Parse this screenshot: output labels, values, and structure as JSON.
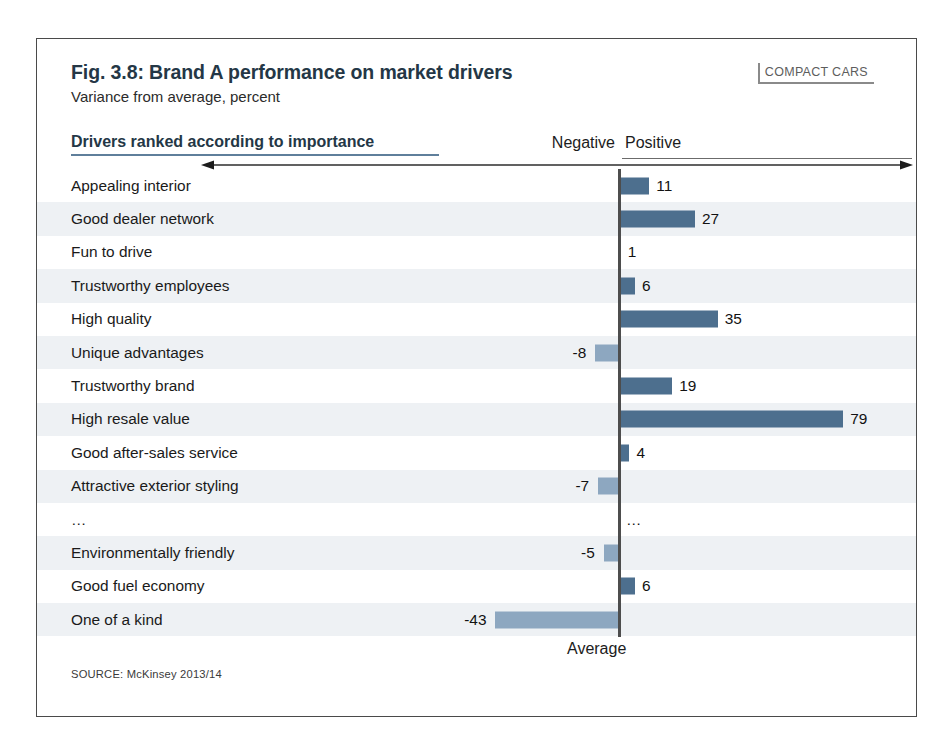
{
  "figure": {
    "title": "Fig. 3.8: Brand A performance on market drivers",
    "subtitle": "Variance from average, percent",
    "segment_tag": "COMPACT CARS",
    "source": "SOURCE: McKinsey 2013/14",
    "column_header": "Drivers ranked according to importance",
    "negative_label": "Negative",
    "positive_label": "Positive",
    "baseline_label": "Average"
  },
  "colors": {
    "title": "#243746",
    "positive_bar": "#4d6f8e",
    "negative_bar": "#8da7c0",
    "header_rule": "#5f7f9b",
    "row_shade": "#eef1f4",
    "axis_line": "#4d4d4d",
    "frame": "#4a4a4a",
    "segment_tag_border": "#8a8a8a"
  },
  "chart_data": {
    "type": "bar",
    "title": "Fig. 3.8: Brand A performance on market drivers",
    "subtitle": "Variance from average, percent",
    "orientation": "horizontal",
    "xlabel": "Variance from average, percent",
    "ylabel": "Drivers ranked according to importance",
    "baseline": 0,
    "baseline_label": "Average",
    "grid": false,
    "legend": null,
    "annotations": [
      "Negative",
      "Positive"
    ],
    "xlim": [
      -50,
      85
    ],
    "note": "Rows ordered top-to-bottom by driver importance; ellipsis row marks omitted drivers",
    "categories": [
      "Appealing interior",
      "Good dealer network",
      "Fun to drive",
      "Trustworthy employees",
      "High quality",
      "Unique advantages",
      "Trustworthy brand",
      "High resale value",
      "Good after-sales service",
      "Attractive exterior styling",
      "…",
      "Environmentally friendly",
      "Good fuel economy",
      "One of a kind"
    ],
    "values": [
      11,
      27,
      1,
      6,
      35,
      -8,
      19,
      79,
      4,
      -7,
      null,
      -5,
      6,
      -43
    ],
    "value_labels": [
      "11",
      "27",
      "1",
      "6",
      "35",
      "-8",
      "19",
      "79",
      "4",
      "-7",
      "…",
      "-5",
      "6",
      "-43"
    ],
    "source": "McKinsey 2013/14"
  },
  "rows": [
    {
      "label": "Appealing interior",
      "value": 11,
      "label_text": "11",
      "sign": "pos",
      "shade": false
    },
    {
      "label": "Good dealer network",
      "value": 27,
      "label_text": "27",
      "sign": "pos",
      "shade": true
    },
    {
      "label": "Fun to drive",
      "value": 1,
      "label_text": "1",
      "sign": "pos",
      "shade": false
    },
    {
      "label": "Trustworthy employees",
      "value": 6,
      "label_text": "6",
      "sign": "pos",
      "shade": true
    },
    {
      "label": "High quality",
      "value": 35,
      "label_text": "35",
      "sign": "pos",
      "shade": false
    },
    {
      "label": "Unique advantages",
      "value": -8,
      "label_text": "-8",
      "sign": "neg",
      "shade": true
    },
    {
      "label": "Trustworthy brand",
      "value": 19,
      "label_text": "19",
      "sign": "pos",
      "shade": false
    },
    {
      "label": "High resale value",
      "value": 79,
      "label_text": "79",
      "sign": "pos",
      "shade": true
    },
    {
      "label": "Good after-sales service",
      "value": 4,
      "label_text": "4",
      "sign": "pos",
      "shade": false
    },
    {
      "label": "Attractive exterior styling",
      "value": -7,
      "label_text": "-7",
      "sign": "neg",
      "shade": true
    },
    {
      "label": "…",
      "value": null,
      "label_text": "…",
      "sign": "none",
      "shade": false
    },
    {
      "label": "Environmentally friendly",
      "value": -5,
      "label_text": "-5",
      "sign": "neg",
      "shade": true
    },
    {
      "label": "Good fuel economy",
      "value": 6,
      "label_text": "6",
      "sign": "pos",
      "shade": false
    },
    {
      "label": "One of a kind",
      "value": -43,
      "label_text": "-43",
      "sign": "neg",
      "shade": true
    }
  ]
}
